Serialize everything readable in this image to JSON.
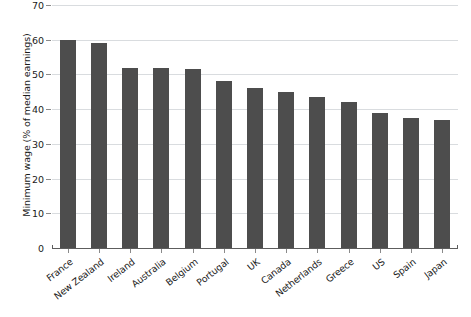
{
  "chart_data": {
    "type": "bar",
    "title": "",
    "subtitle": "",
    "xlabel": "",
    "ylabel": "Minimum wage (% of median earnings)",
    "ylim": [
      0,
      70
    ],
    "ytick_step": 10,
    "yticks": [
      0,
      10,
      20,
      30,
      40,
      50,
      60,
      70
    ],
    "ytick_labels": [
      "0",
      "10",
      "20",
      "30",
      "40",
      "50",
      "60",
      "70"
    ],
    "grid": true,
    "grid_axis": "y",
    "legend": false,
    "legend_position": "none",
    "x_tick_label_rotation": -38,
    "bar_color": "#4d4d4d",
    "gridline_color": "#d9dcdf",
    "axis_color": "#5d5d5d",
    "background_color": "#ffffff",
    "categories": [
      "France",
      "New Zealand",
      "Ireland",
      "Australia",
      "Belgium",
      "Portugal",
      "UK",
      "Canada",
      "Netherlands",
      "Greece",
      "US",
      "Spain",
      "Japan"
    ],
    "values": [
      60,
      59,
      52,
      52,
      51.5,
      48,
      46,
      45,
      43.5,
      42,
      39,
      37.5,
      37
    ]
  }
}
